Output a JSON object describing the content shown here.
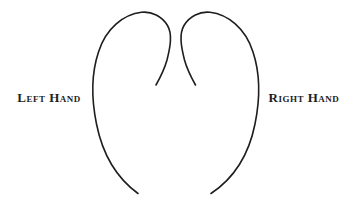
{
  "figure": {
    "left_label": "Left Hand",
    "right_label": "Right Hand",
    "ink_color": "#1e1e1e",
    "background_color": "#ffffff",
    "left_curve_path": "M 156 85 C 160.5 77 164.5 69 167 60 C 170.5 46 172.5 34 167.5 25.5 C 162 16 151.5 11.2 141.5 12.3 C 124 14.3 106 28 98.5 52 C 91.5 73 91 97 96.5 124 C 101.5 149 114 176 138 193.5",
    "right_curve_path": "M 195.5 85 C 191 77 187 69 184.5 60 C 181 46 179 34 184 25.5 C 189.5 16 200 11.2 210 12.3 C 227.5 14.3 245.5 28 253 52 C 260 73 260.5 97 255 124 C 250 149 237.5 176 211 193.5"
  }
}
